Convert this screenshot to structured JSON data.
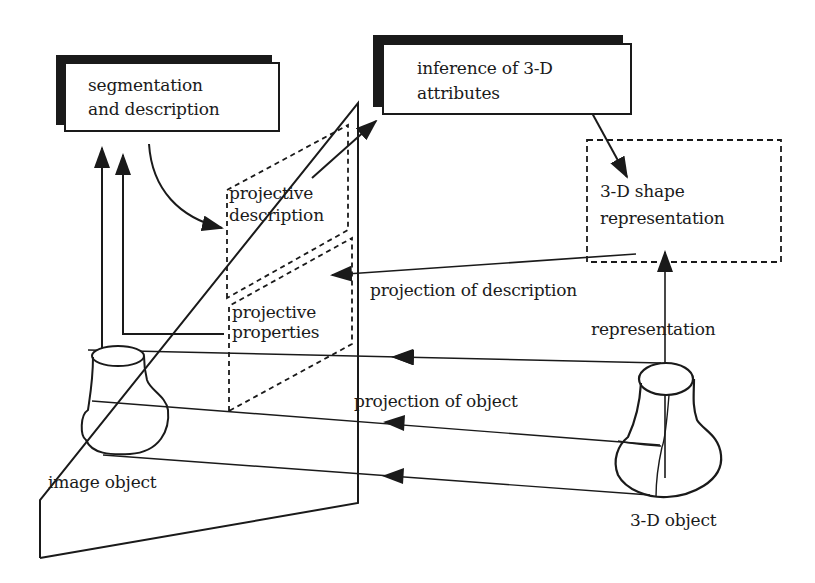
{
  "diagram": {
    "title": "",
    "nodes": {
      "segmentation": {
        "line1": "segmentation",
        "line2": "and description",
        "style": "solid box with shadow"
      },
      "inference": {
        "line1": "inference of 3-D",
        "line2": "attributes",
        "style": "solid box with shadow"
      },
      "shape_repr": {
        "line1": "3-D shape",
        "line2": "representation",
        "style": "dashed box"
      },
      "proj_description": {
        "line1": "projective",
        "line2": "description",
        "style": "dashed parallelogram on image plane"
      },
      "proj_properties": {
        "line1": "projective",
        "line2": "properties",
        "style": "dashed parallelogram on image plane"
      },
      "image_object": {
        "label": "image object"
      },
      "object_3d": {
        "label": "3-D object"
      }
    },
    "edge_labels": {
      "projection_of_description": "projection of description",
      "representation": "representation",
      "projection_of_object": "projection of object"
    },
    "colors": {
      "ink": "#1a1a1a",
      "background": "#ffffff"
    }
  }
}
